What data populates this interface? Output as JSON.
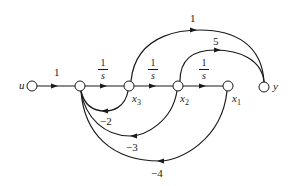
{
  "diagram": {
    "type": "signal-flow-graph",
    "nodes": [
      {
        "id": "u",
        "label": "u",
        "x": 32,
        "y": 86
      },
      {
        "id": "n1",
        "label": "",
        "x": 80,
        "y": 86
      },
      {
        "id": "x3",
        "label": "x",
        "sub": "3",
        "x": 129,
        "y": 86
      },
      {
        "id": "x2",
        "label": "x",
        "sub": "2",
        "x": 178,
        "y": 86
      },
      {
        "id": "x1",
        "label": "x",
        "sub": "1",
        "x": 228,
        "y": 86
      },
      {
        "id": "y",
        "label": "y",
        "x": 264,
        "y": 87
      }
    ],
    "edges": [
      {
        "from": "u",
        "to": "n1",
        "gain": "1"
      },
      {
        "from": "n1",
        "to": "x3",
        "gain_num": "1",
        "gain_den": "s"
      },
      {
        "from": "x3",
        "to": "x2",
        "gain_num": "1",
        "gain_den": "s"
      },
      {
        "from": "x2",
        "to": "x1",
        "gain_num": "1",
        "gain_den": "s"
      },
      {
        "from": "x3",
        "to": "y",
        "gain": "1"
      },
      {
        "from": "x2",
        "to": "y",
        "gain": "5"
      },
      {
        "from": "x3",
        "to": "n1",
        "gain": "−2"
      },
      {
        "from": "x2",
        "to": "n1",
        "gain": "−3"
      },
      {
        "from": "x1",
        "to": "n1",
        "gain": "−4"
      }
    ],
    "colors": {
      "stroke": "#1a1a1a",
      "background": "#ffffff"
    }
  }
}
